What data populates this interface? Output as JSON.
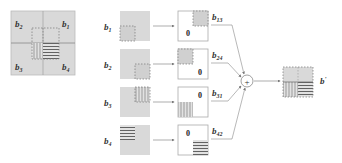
{
  "diagram": {
    "colors": {
      "block_fill": "#d9d9d9",
      "line": "#888888",
      "text": "#333333",
      "white": "#ffffff"
    },
    "source_block": {
      "quadrant_labels": [
        {
          "base": "b",
          "sub": "2",
          "pos": "top-left"
        },
        {
          "base": "b",
          "sub": "1",
          "pos": "top-right"
        },
        {
          "base": "b",
          "sub": "3",
          "pos": "bottom-left"
        },
        {
          "base": "b",
          "sub": "4",
          "pos": "bottom-right"
        }
      ]
    },
    "rows": [
      {
        "input": {
          "base": "b",
          "sub": "1"
        },
        "zero": "0",
        "output": {
          "base": "b",
          "sub": "13"
        }
      },
      {
        "input": {
          "base": "b",
          "sub": "2"
        },
        "zero": "0",
        "output": {
          "base": "b",
          "sub": "24"
        }
      },
      {
        "input": {
          "base": "b",
          "sub": "3"
        },
        "zero": "0",
        "output": {
          "base": "b",
          "sub": "31"
        }
      },
      {
        "input": {
          "base": "b",
          "sub": "4"
        },
        "zero": "0",
        "output": {
          "base": "b",
          "sub": "42"
        }
      }
    ],
    "operator": "+",
    "result": {
      "base": "b",
      "prime": "'"
    }
  }
}
